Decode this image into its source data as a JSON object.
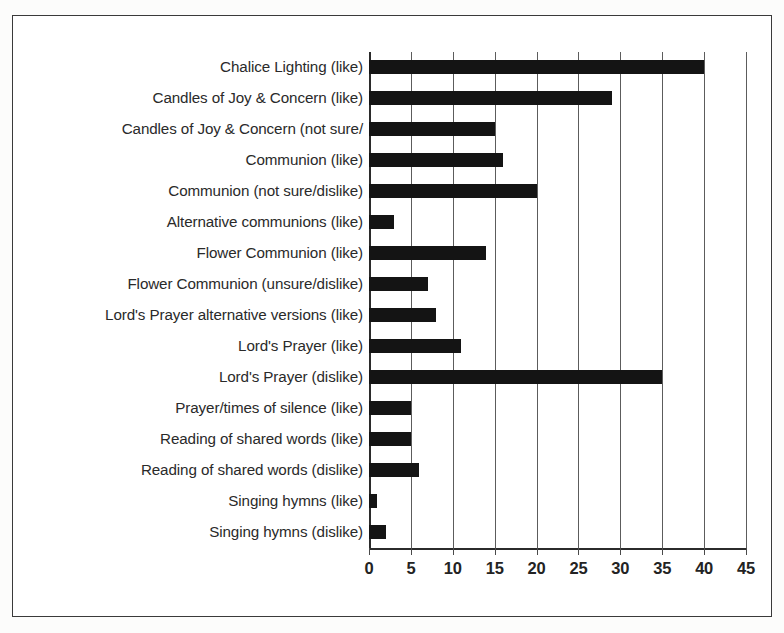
{
  "figure": {
    "background_color": "#fcfcfb",
    "frame_color": "#3a3a3a",
    "bar_color": "#141414",
    "gridline_color": "#5c5c5c"
  },
  "chart_data": {
    "type": "bar",
    "orientation": "horizontal",
    "title": "",
    "subtitle": "",
    "xlabel": "",
    "ylabel": "",
    "xlim": [
      0,
      45
    ],
    "ylim": null,
    "grid": true,
    "legend": null,
    "xticks": [
      0,
      5,
      10,
      15,
      20,
      25,
      30,
      35,
      40,
      45
    ],
    "xticklabels": [
      "0",
      "5",
      "10",
      "15",
      "20",
      "25",
      "30",
      "35",
      "40",
      "45"
    ],
    "categories": [
      "Chalice Lighting (like)",
      "Candles of Joy & Concern (like)",
      "Candles of Joy & Concern (not sure/",
      "Communion (like)",
      "Communion (not sure/dislike)",
      "Alternative communions (like)",
      "Flower Communion (like)",
      "Flower Communion (unsure/dislike)",
      "Lord's Prayer alternative versions (like)",
      "Lord's Prayer (like)",
      "Lord's Prayer (dislike)",
      "Prayer/times of silence (like)",
      "Reading of shared words (like)",
      "Reading of shared words (dislike)",
      "Singing hymns (like)",
      "Singing hymns (dislike)"
    ],
    "values": [
      40,
      29,
      15,
      16,
      20,
      3,
      14,
      7,
      8,
      11,
      35,
      5,
      5,
      6,
      1,
      2
    ]
  }
}
